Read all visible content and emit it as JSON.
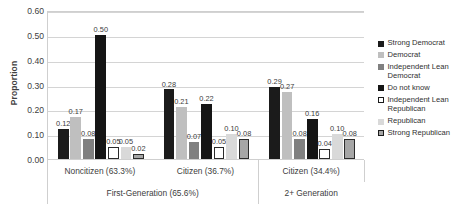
{
  "chart_data": {
    "type": "bar",
    "title": "",
    "subtitle": "",
    "xlabel": "",
    "ylabel": "Proportion",
    "ylim": [
      0.0,
      0.6
    ],
    "ytick_labels": [
      "0.00",
      "0.10",
      "0.20",
      "0.30",
      "0.40",
      "0.50",
      "0.60"
    ],
    "ytick_values": [
      0.0,
      0.1,
      0.2,
      0.3,
      0.4,
      0.5,
      0.6
    ],
    "grid": true,
    "legend_position": "right",
    "categories": [
      "Noncitizen (63.3%)",
      "Citizen (36.7%)",
      "Citizen (34.4%)"
    ],
    "group_headers": [
      {
        "label": "First-Generation (65.6%)",
        "spans": 2
      },
      {
        "label": "2+ Generation",
        "spans": 1
      }
    ],
    "series": [
      {
        "name": "Strong Democrat",
        "values": [
          0.12,
          0.28,
          0.29
        ],
        "labels": [
          "0.12",
          "0.28",
          "0.29"
        ],
        "color": "#1b1b1b"
      },
      {
        "name": "Democrat",
        "values": [
          0.17,
          0.21,
          0.27
        ],
        "labels": [
          "0.17",
          "0.21",
          "0.27"
        ],
        "color": "#bfbfbf"
      },
      {
        "name": "Independent Lean Democrat",
        "values": [
          0.08,
          0.07,
          0.08
        ],
        "labels": [
          "0.08",
          "0.07",
          "0.08"
        ],
        "color": "#808080"
      },
      {
        "name": "Do not know",
        "values": [
          0.5,
          0.22,
          0.16
        ],
        "labels": [
          "0.50",
          "0.22",
          "0.16"
        ],
        "color": "#151515"
      },
      {
        "name": "Independent Lean Republican",
        "values": [
          0.05,
          0.05,
          0.04
        ],
        "labels": [
          "0.05",
          "0.05",
          "0.04"
        ],
        "color": "#ffffff"
      },
      {
        "name": "Republican",
        "values": [
          0.05,
          0.1,
          0.1
        ],
        "labels": [
          "0.05",
          "0.10",
          "0.10"
        ],
        "color": "#d9d9d9"
      },
      {
        "name": "Strong Republican",
        "values": [
          0.02,
          0.08,
          0.08
        ],
        "labels": [
          "0.02",
          "0.08",
          "0.08"
        ],
        "color": "#a6a6a6"
      }
    ]
  },
  "legend": {
    "items": [
      {
        "label": "Strong Democrat"
      },
      {
        "label": "Democrat"
      },
      {
        "label": "Independent Lean Democrat"
      },
      {
        "label": "Do not know"
      },
      {
        "label": "Independent Lean Republican"
      },
      {
        "label": "Republican"
      },
      {
        "label": "Strong Republican"
      }
    ]
  }
}
